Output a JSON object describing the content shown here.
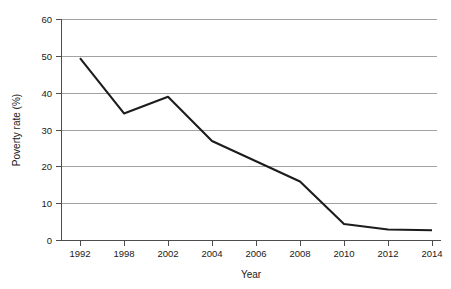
{
  "chart_data": {
    "type": "line",
    "title": "",
    "xlabel": "Year",
    "ylabel": "Poverty rate (%)",
    "x": [
      "1992",
      "1998",
      "2002",
      "2004",
      "2006",
      "2008",
      "2010",
      "2012",
      "2014"
    ],
    "categories": [
      "1992",
      "1998",
      "2002",
      "2004",
      "2006",
      "2008",
      "2010",
      "2012",
      "2014"
    ],
    "values": [
      49.5,
      34.5,
      39.0,
      27.0,
      21.5,
      16.0,
      4.5,
      3.0,
      2.8
    ],
    "series": [
      {
        "name": "Poverty rate",
        "values": [
          49.5,
          34.5,
          39.0,
          27.0,
          21.5,
          16.0,
          4.5,
          3.0,
          2.8
        ]
      }
    ],
    "ylim": [
      0,
      60
    ],
    "yticks": [
      0,
      10,
      20,
      30,
      40,
      50,
      60
    ],
    "ytick_labels": [
      "0",
      "10",
      "20",
      "30",
      "40",
      "50",
      "60"
    ],
    "xtick_labels": [
      "1992",
      "1998",
      "2002",
      "2004",
      "2006",
      "2008",
      "2010",
      "2012",
      "2014"
    ],
    "grid": "horizontal",
    "legend": "none",
    "line_color": "#1c1c1c",
    "grid_color": "#8a8a8a",
    "axis_color": "#4d4d4d"
  },
  "labels": {
    "x_axis_title": "Year",
    "y_axis_title": "Poverty rate (%)"
  }
}
